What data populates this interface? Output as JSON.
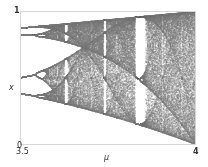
{
  "chart_data": {
    "type": "scatter",
    "title": "",
    "xlabel": "μ",
    "ylabel": "x",
    "xlim": [
      3.5,
      4.0
    ],
    "ylim": [
      0,
      1
    ],
    "x_tick_labels": [
      "3.5",
      "4"
    ],
    "y_tick_labels": [
      "0",
      "1"
    ],
    "grid": false,
    "legend": null,
    "series": [
      {
        "name": "logistic map attractor",
        "map": "logistic",
        "mu_start": 3.5,
        "mu_end": 4.0,
        "mu_steps": 700,
        "transient_iterations": 300,
        "plotted_iterations": 120,
        "point_color": "#7a7a7a",
        "notable_features": [
          {
            "mu": 3.5,
            "x_values": [
              0.383,
              0.501,
              0.827,
              0.875
            ],
            "note": "period-4 cycle at left edge"
          },
          {
            "mu": 3.5699,
            "note": "onset of chaos"
          },
          {
            "mu_range": [
              3.8284,
              3.857
            ],
            "note": "period-3 window (white vertical band)"
          },
          {
            "mu": 4.0,
            "x_range": [
              0,
              1
            ],
            "note": "fully chaotic band"
          }
        ]
      }
    ]
  },
  "axes": {
    "y_top_label": "1",
    "y_bottom_label": "0",
    "x_left_label": "3.5",
    "x_right_label": "4",
    "x_axis_title": "μ",
    "y_axis_title": "x"
  },
  "colors": {
    "frame": "#d6d6d6",
    "points": "#7a7a7a",
    "background": "#ffffff"
  }
}
